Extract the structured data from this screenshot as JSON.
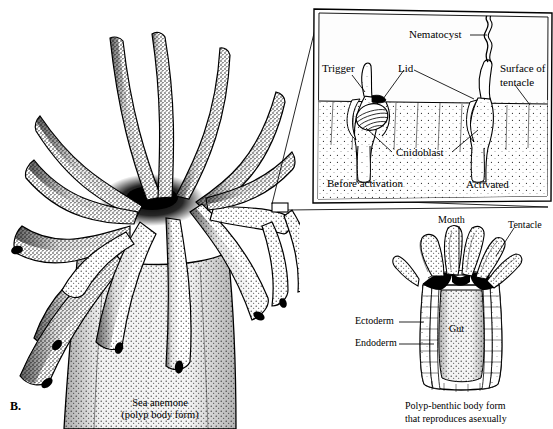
{
  "figure": {
    "letter": "B.",
    "main_caption_line1": "Sea anemone",
    "main_caption_line2": "(polyp body form)"
  },
  "inset": {
    "title_implied": "Nematocyst discharge detail",
    "labels": {
      "nematocyst": "Nematocyst",
      "trigger": "Trigger",
      "lid": "Lid",
      "cnidoblast": "Cnidoblast",
      "surface_line1": "Surface of",
      "surface_line2": "tentacle",
      "state_before": "Before activation",
      "state_after": "Activated"
    }
  },
  "polyp": {
    "labels": {
      "mouth": "Mouth",
      "tentacle": "Tentacle",
      "ectoderm": "Ectoderm",
      "endoderm": "Endoderm",
      "gut": "Gut"
    },
    "caption_line1": "Polyp-benthic body form",
    "caption_line2": "that reproduces asexually"
  },
  "colors": {
    "ink": "#000000",
    "paper": "#ffffff",
    "stipple": "#1a1a1a",
    "inset_fill": "#fdfdfd"
  }
}
